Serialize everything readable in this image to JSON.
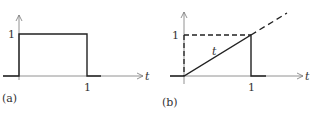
{
  "panels": [
    {
      "id": "a",
      "caption": "(a)",
      "y_tick": "1",
      "x_tick": "1",
      "x_axis_label": "t",
      "description": "Unit rectangular pulse: 1 for 0<t<1, 0 otherwise"
    },
    {
      "id": "b",
      "caption": "(b)",
      "y_tick": "1",
      "x_tick": "1",
      "x_axis_label": "t",
      "ramp_label": "t",
      "description": "Ramp t for 0<t<1, then drops to 0; dashed continuation of t and dashed guide at level 1"
    }
  ],
  "colors": {
    "line": "#222222",
    "axis": "#555555",
    "text": "#333333"
  }
}
